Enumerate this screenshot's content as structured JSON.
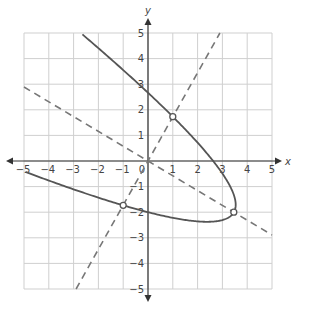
{
  "chart_data": {
    "type": "line",
    "title": "",
    "xlabel": "x",
    "ylabel": "y",
    "xlim": [
      -5,
      5
    ],
    "ylim": [
      -5,
      5
    ],
    "grid": true,
    "x_ticks": [
      -5,
      -4,
      -3,
      -2,
      -1,
      1,
      2,
      3,
      4,
      5
    ],
    "y_ticks": [
      -5,
      -4,
      -3,
      -2,
      -1,
      1,
      2,
      3,
      4,
      5
    ],
    "origin_label": "0",
    "series": [
      {
        "name": "rotated parabola",
        "style": "solid",
        "description": "u = 4 - v^2 where u = (sqrt3/2)x - y/2, v = x/2 + (sqrt3/2)y",
        "sample_points": [
          [
            -2.2,
            5
          ],
          [
            0,
            2.7
          ],
          [
            1,
            1.73
          ],
          [
            3,
            0
          ],
          [
            3.46,
            -2
          ],
          [
            2.5,
            -2.4
          ],
          [
            0,
            -2.05
          ],
          [
            -1,
            -1.73
          ],
          [
            -5,
            -0.75
          ]
        ]
      },
      {
        "name": "dashed line y = sqrt(3) x",
        "style": "dashed",
        "slope": 1.732,
        "intercept": 0,
        "endpoints": [
          [
            -2.9,
            -5
          ],
          [
            2.9,
            5
          ]
        ]
      },
      {
        "name": "dashed line y = -x / sqrt(3)",
        "style": "dashed",
        "slope": -0.577,
        "intercept": 0,
        "endpoints": [
          [
            -5,
            2.89
          ],
          [
            5,
            -2.89
          ]
        ]
      }
    ],
    "points": [
      {
        "label": "intersection 1",
        "x": 1,
        "y": 1.73,
        "marker": "open-circle"
      },
      {
        "label": "intersection 2",
        "x": -1,
        "y": -1.73,
        "marker": "open-circle"
      },
      {
        "label": "intersection 3",
        "x": 3.46,
        "y": -2,
        "marker": "open-circle"
      }
    ]
  },
  "colors": {
    "grid": "#cfcfcf",
    "axis": "#333333",
    "curve": "#555555",
    "dashed": "#777777"
  }
}
